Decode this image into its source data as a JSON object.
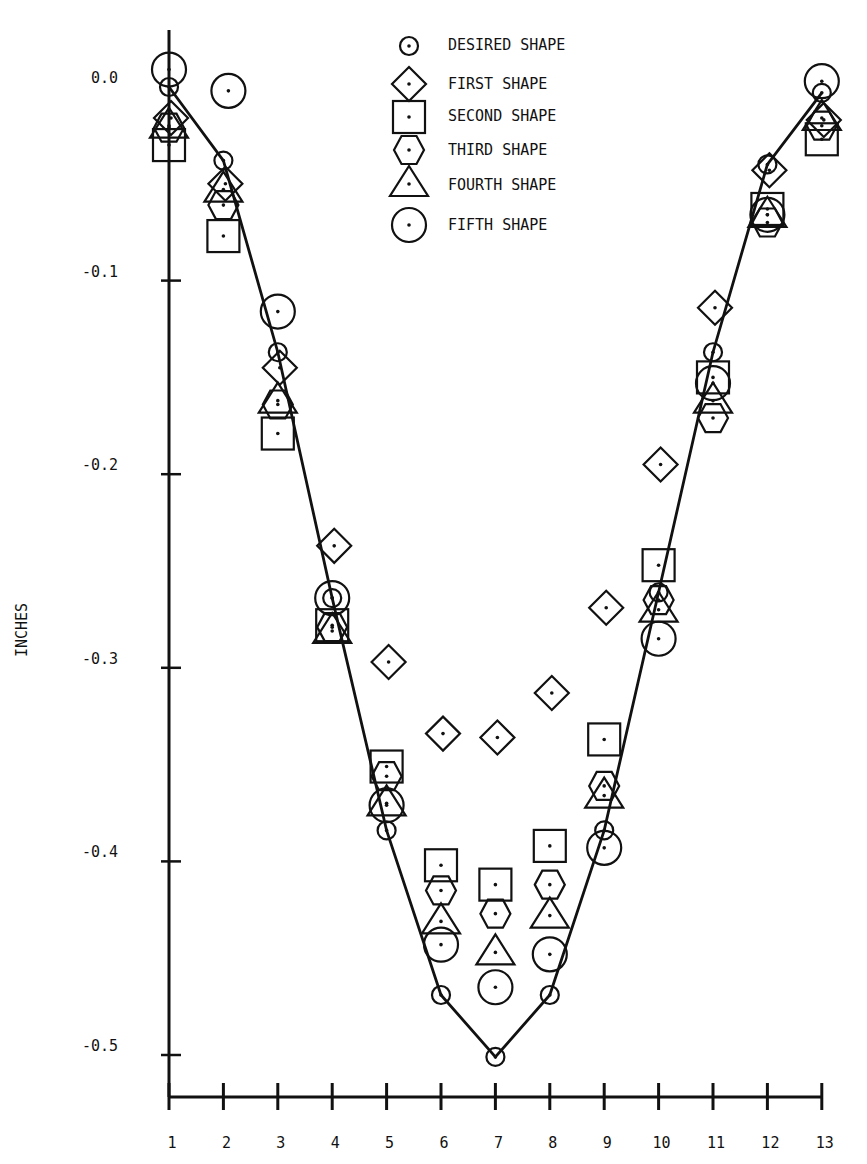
{
  "chart_data": {
    "type": "scatter",
    "title": "",
    "xlabel": "",
    "ylabel": "INCHES",
    "x": [
      1,
      2,
      3,
      4,
      5,
      6,
      7,
      8,
      9,
      10,
      11,
      12,
      13
    ],
    "x_tick_labels": [
      "1",
      "2",
      "3",
      "4",
      "5",
      "6",
      "7",
      "8",
      "9",
      "10",
      "11",
      "12",
      "13"
    ],
    "y_ticks": [
      0.0,
      -0.1,
      -0.2,
      -0.3,
      -0.4,
      -0.5
    ],
    "y_tick_labels": [
      "0.0",
      "-0.1",
      "-0.2",
      "-0.3",
      "-0.4",
      "-0.5"
    ],
    "xlim": [
      1,
      13
    ],
    "ylim": [
      -0.53,
      0.05
    ],
    "grid": false,
    "legend_position": "top-center",
    "series": [
      {
        "name": "DESIRED SHAPE",
        "marker": "small-circle",
        "line": true,
        "values": [
          0.0,
          -0.038,
          -0.137,
          -0.264,
          -0.384,
          -0.469,
          -0.501,
          -0.469,
          -0.384,
          -0.261,
          -0.137,
          -0.04,
          -0.003
        ]
      },
      {
        "name": "FIRST SHAPE",
        "marker": "diamond",
        "line": false,
        "values": [
          -0.016,
          -0.05,
          -0.145,
          -0.237,
          -0.297,
          -0.334,
          -0.336,
          -0.313,
          -0.269,
          -0.195,
          -0.114,
          -0.043,
          -0.017
        ]
      },
      {
        "name": "SECOND SHAPE",
        "marker": "square",
        "line": false,
        "values": [
          -0.03,
          -0.077,
          -0.179,
          -0.278,
          -0.351,
          -0.402,
          -0.412,
          -0.392,
          -0.337,
          -0.247,
          -0.15,
          -0.063,
          -0.027
        ]
      },
      {
        "name": "THIRD SHAPE",
        "marker": "hexagon",
        "line": false,
        "values": [
          -0.021,
          -0.061,
          -0.164,
          -0.279,
          -0.356,
          -0.415,
          -0.427,
          -0.412,
          -0.361,
          -0.265,
          -0.171,
          -0.07,
          -0.02
        ]
      },
      {
        "name": "FOURTH SHAPE",
        "marker": "triangle",
        "line": false,
        "values": [
          -0.02,
          -0.053,
          -0.162,
          -0.281,
          -0.37,
          -0.431,
          -0.447,
          -0.428,
          -0.366,
          -0.27,
          -0.162,
          -0.066,
          -0.016
        ]
      },
      {
        "name": "FIFTH SHAPE",
        "marker": "large-circle",
        "line": false,
        "values": [
          0.009,
          -0.002,
          -0.116,
          -0.264,
          -0.371,
          -0.443,
          -0.465,
          -0.448,
          -0.393,
          -0.285,
          -0.153,
          -0.066,
          0.003
        ]
      }
    ]
  },
  "legend": [
    {
      "label": "DESIRED SHAPE",
      "marker": "small-circle"
    },
    {
      "label": "FIRST SHAPE",
      "marker": "diamond"
    },
    {
      "label": "SECOND SHAPE",
      "marker": "square"
    },
    {
      "label": "THIRD SHAPE",
      "marker": "hexagon"
    },
    {
      "label": "FOURTH SHAPE",
      "marker": "triangle"
    },
    {
      "label": "FIFTH SHAPE",
      "marker": "large-circle"
    }
  ],
  "axis": {
    "ylabel": "INCHES"
  },
  "colors": {
    "ink": "#111111",
    "background": "#ffffff"
  }
}
